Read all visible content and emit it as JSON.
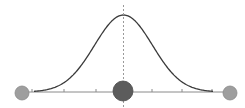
{
  "diagram": {
    "type": "gaussian-bell-curve",
    "width": 245,
    "height": 108,
    "colors": {
      "background": "#ffffff",
      "curve": "#3a3a3a",
      "axis": "#8a8a8a",
      "ticks": "#8a8a8a",
      "mean_line": "#9a9a9a",
      "center_marker_fill": "#5c5c5c",
      "center_marker_stroke": "#4a4a4a",
      "side_marker_fill": "#9e9e9e",
      "side_marker_stroke": "#8a8a8a"
    },
    "axis": {
      "x1": 28,
      "x2": 224,
      "y": 92
    },
    "ticks_x": [
      32,
      64,
      96,
      152,
      182,
      212
    ],
    "mean_line": {
      "x": 123.5,
      "y1": 5,
      "y2": 107,
      "dashed": true
    },
    "curve": {
      "mean_x": 123.5,
      "baseline_y": 92,
      "peak_y": 15,
      "sigma_px": 29,
      "x_start": 34,
      "x_end": 213
    },
    "markers": [
      {
        "name": "left-endpoint-marker",
        "cx": 22,
        "cy": 93,
        "r": 7,
        "style": "side"
      },
      {
        "name": "center-mean-marker",
        "cx": 123,
        "cy": 91,
        "r": 10,
        "style": "center"
      },
      {
        "name": "right-endpoint-marker",
        "cx": 230,
        "cy": 93,
        "r": 7,
        "style": "side"
      }
    ]
  }
}
